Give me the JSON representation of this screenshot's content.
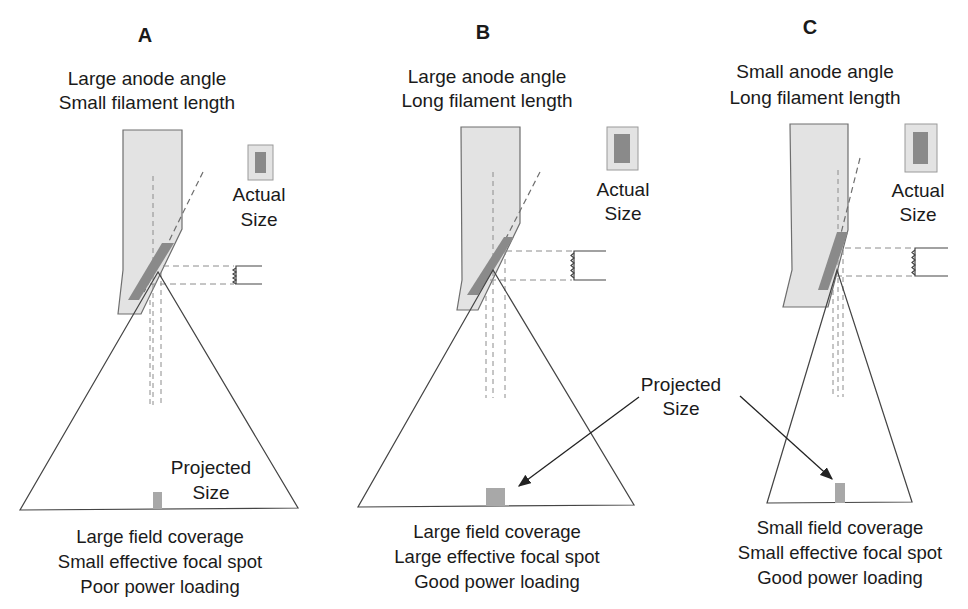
{
  "colors": {
    "anode_fill": "#e3e3e3",
    "anode_stroke": "#6e6e6e",
    "focal_track": "#8a8a8a",
    "spot_fill": "#a8a8a8",
    "dash": "#8c8c8c",
    "line": "#3a3a3a"
  },
  "panels": [
    {
      "letter": "A",
      "title_line1": "Large anode angle",
      "title_line2": "Small filament length",
      "actual_label_1": "Actual",
      "actual_label_2": "Size",
      "projected_label_1": "Projected",
      "projected_label_2": "Size",
      "caption": [
        "Large field coverage",
        "Small effective focal spot",
        "Poor power loading"
      ]
    },
    {
      "letter": "B",
      "title_line1": "Large anode angle",
      "title_line2": "Long filament length",
      "actual_label_1": "Actual",
      "actual_label_2": "Size",
      "caption": [
        "Large field coverage",
        "Large effective focal spot",
        "Good power loading"
      ]
    },
    {
      "letter": "C",
      "title_line1": "Small anode angle",
      "title_line2": "Long filament length",
      "actual_label_1": "Actual",
      "actual_label_2": "Size",
      "caption": [
        "Small field coverage",
        "Small effective focal spot",
        "Good power loading"
      ]
    }
  ],
  "shared_projected_label_1": "Projected",
  "shared_projected_label_2": "Size"
}
